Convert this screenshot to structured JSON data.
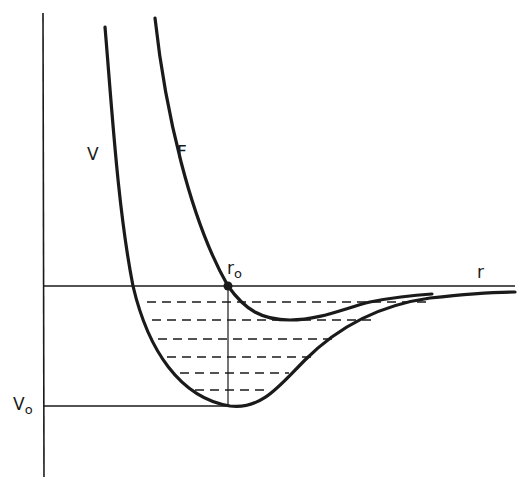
{
  "diagram": {
    "type": "potential-energy-curves",
    "curves": [
      {
        "id": "V",
        "label": "V",
        "description": "potential energy curve with minimum V0 at r0"
      },
      {
        "id": "F",
        "label": "F",
        "description": "curve crossing zero axis at r0"
      }
    ],
    "axes": {
      "x_label": "r",
      "y_marker_label": "V",
      "y_marker_sub": "o"
    },
    "point": {
      "label": "r",
      "sub": "o"
    },
    "energy_levels_count": 6,
    "colors": {
      "ink": "#1a1a1a",
      "background": "#ffffff"
    }
  }
}
